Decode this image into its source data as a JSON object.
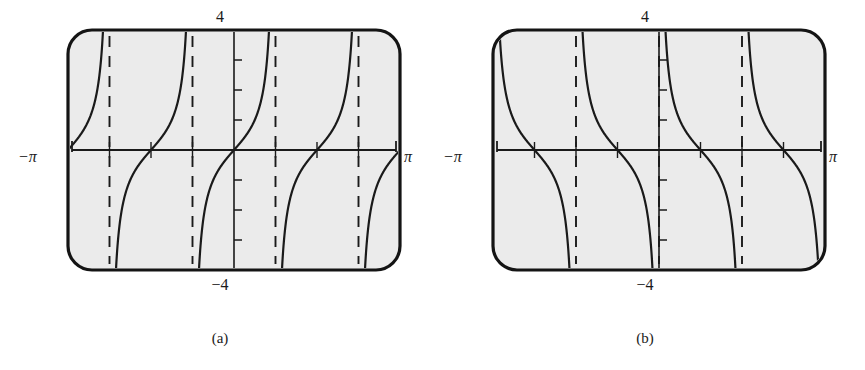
{
  "figure": {
    "background": "#ffffff",
    "ink": "#1a1a1a",
    "plot_fill": "#ebebeb",
    "frame_color": "#141414"
  },
  "panels": [
    {
      "id": "a",
      "caption": "(a)",
      "top_label": "4",
      "bottom_label": "−4",
      "left_label": "−π",
      "right_label": "π",
      "function_name": "tan-2x",
      "branch_direction": "increasing",
      "chart_ref": 0
    },
    {
      "id": "b",
      "caption": "(b)",
      "top_label": "4",
      "bottom_label": "−4",
      "left_label": "−π",
      "right_label": "π",
      "function_name": "cot-2x",
      "branch_direction": "decreasing",
      "chart_ref": 1
    }
  ],
  "chart_data": [
    {
      "type": "line",
      "title": "",
      "subtitle": "",
      "xlabel": "",
      "ylabel": "",
      "xlim": [
        -3.14159265,
        3.14159265
      ],
      "ylim": [
        -4,
        4
      ],
      "grid": false,
      "legend": null,
      "xtick_labels": [
        "−π",
        "π"
      ],
      "ytick_labels": [
        "4",
        "−4"
      ],
      "x_axis_ticks": [
        -2.35619449,
        -1.57079633,
        -0.78539816,
        0.78539816,
        1.57079633,
        2.35619449
      ],
      "y_axis_ticks": [
        -3,
        -2,
        -1,
        1,
        2,
        3
      ],
      "asymptotes": [
        -2.35619449,
        -0.78539816,
        0.78539816,
        2.35619449
      ],
      "asymptote_style": "dashed",
      "series": [
        {
          "name": "y = tan 2x",
          "formula": "tan(2x)",
          "period": 1.57079633,
          "zeros": [
            -3.14159265,
            -1.57079633,
            0,
            1.57079633,
            3.14159265
          ],
          "branch_intervals": [
            [
              -3.14159265,
              -2.35619449
            ],
            [
              -2.35619449,
              -0.78539816
            ],
            [
              -0.78539816,
              0.78539816
            ],
            [
              0.78539816,
              2.35619449
            ],
            [
              2.35619449,
              3.14159265
            ]
          ]
        }
      ],
      "annotations": [
        "4",
        "−4",
        "−π",
        "π"
      ]
    },
    {
      "type": "line",
      "title": "",
      "subtitle": "",
      "xlabel": "",
      "ylabel": "",
      "xlim": [
        -3.14159265,
        3.14159265
      ],
      "ylim": [
        -4,
        4
      ],
      "grid": false,
      "legend": null,
      "xtick_labels": [
        "−π",
        "π"
      ],
      "ytick_labels": [
        "4",
        "−4"
      ],
      "x_axis_ticks": [
        -2.35619449,
        -1.57079633,
        -0.78539816,
        0.78539816,
        1.57079633,
        2.35619449
      ],
      "y_axis_ticks": [
        -3,
        -2,
        -1,
        1,
        2,
        3
      ],
      "asymptotes": [
        -1.57079633,
        0,
        1.57079633
      ],
      "asymptote_extra": [
        -3.14159265,
        3.14159265
      ],
      "asymptote_style": "dashed",
      "series": [
        {
          "name": "y = cot 2x",
          "formula": "cot(2x)",
          "period": 1.57079633,
          "zeros": [
            -2.35619449,
            -0.78539816,
            0.78539816,
            2.35619449
          ],
          "branch_intervals": [
            [
              -3.14159265,
              -1.57079633
            ],
            [
              -1.57079633,
              0
            ],
            [
              0,
              1.57079633
            ],
            [
              1.57079633,
              3.14159265
            ]
          ]
        }
      ],
      "annotations": [
        "4",
        "−4",
        "−π",
        "π"
      ]
    }
  ]
}
